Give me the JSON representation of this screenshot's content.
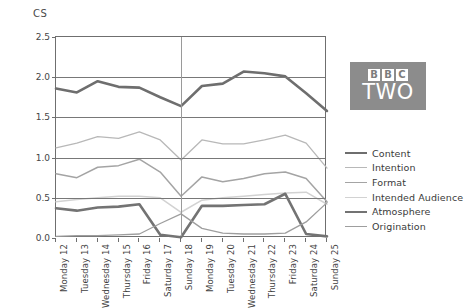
{
  "chart_data": {
    "type": "line",
    "title": "",
    "ylabel": "CS",
    "xlabel": "",
    "ylim": [
      0.0,
      2.5
    ],
    "yticks": [
      "0.0",
      "0.5",
      "1.0",
      "1.5",
      "2.0",
      "2.5"
    ],
    "ytick_values": [
      0.0,
      0.5,
      1.0,
      1.5,
      2.0,
      2.5
    ],
    "grid": true,
    "grid_axis": "y",
    "legend_position": "right",
    "reference_line": {
      "axis": "x",
      "at_category": "Sunday 18",
      "color": "#9a9a9a"
    },
    "categories": [
      "Monday 12",
      "Tuesday 13",
      "Wednesday 14",
      "Thursday 15",
      "Friday 16",
      "Saturday 17",
      "Sunday 18",
      "Monday 19",
      "Tuesday 20",
      "Wednesday 21",
      "Thursday 22",
      "Friday 23",
      "Saturday 24",
      "Sunday 25"
    ],
    "series": [
      {
        "name": "Content",
        "color": "#6e6e6e",
        "width": 2.6,
        "values": [
          1.86,
          1.81,
          1.95,
          1.88,
          1.87,
          1.75,
          1.64,
          1.89,
          1.92,
          2.07,
          2.05,
          2.01,
          1.8,
          1.58
        ]
      },
      {
        "name": "Intention",
        "color": "#b8b8b8",
        "width": 1.3,
        "values": [
          1.12,
          1.18,
          1.26,
          1.24,
          1.32,
          1.22,
          0.97,
          1.22,
          1.17,
          1.17,
          1.22,
          1.28,
          1.18,
          0.87
        ]
      },
      {
        "name": "Format",
        "color": "#a4a4a4",
        "width": 1.5,
        "values": [
          0.8,
          0.75,
          0.88,
          0.9,
          0.98,
          0.82,
          0.52,
          0.76,
          0.7,
          0.74,
          0.8,
          0.82,
          0.74,
          0.45
        ]
      },
      {
        "name": "Intended Audience",
        "color": "#d2d2d2",
        "width": 1.5,
        "values": [
          0.45,
          0.48,
          0.5,
          0.52,
          0.52,
          0.5,
          0.32,
          0.47,
          0.5,
          0.52,
          0.54,
          0.56,
          0.57,
          0.42
        ]
      },
      {
        "name": "Atmosphere",
        "color": "#737373",
        "width": 2.6,
        "values": [
          0.37,
          0.34,
          0.38,
          0.39,
          0.42,
          0.04,
          0.01,
          0.4,
          0.4,
          0.41,
          0.42,
          0.55,
          0.05,
          0.02
        ]
      },
      {
        "name": "Origination",
        "color": "#9e9e9e",
        "width": 1.3,
        "values": [
          0.02,
          0.03,
          0.03,
          0.04,
          0.05,
          0.18,
          0.3,
          0.12,
          0.06,
          0.05,
          0.05,
          0.06,
          0.2,
          0.44
        ]
      }
    ]
  },
  "legend": {
    "items": [
      {
        "label": "Content"
      },
      {
        "label": "Intention"
      },
      {
        "label": "Format"
      },
      {
        "label": "Intended Audience"
      },
      {
        "label": "Atmosphere"
      },
      {
        "label": "Origination"
      }
    ]
  },
  "logo": {
    "letters": [
      "B",
      "B",
      "C"
    ],
    "word": "TWO",
    "background": "#8c8c8c"
  }
}
